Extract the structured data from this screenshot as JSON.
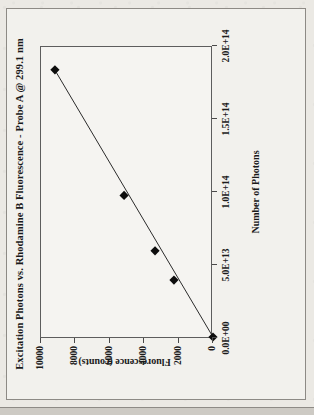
{
  "figure": {
    "background_color": "#ebe9e4",
    "frame_color": "#8d8a85",
    "rotation_note": "90-degrees-counter-clockwise"
  },
  "chart_data": {
    "type": "scatter",
    "title": "Excitation Photons vs. Rhodamine B Fluorescence - Probe A @ 299.1 nm",
    "xlabel": "Number of Photons",
    "ylabel": "Fluorescence (counts)",
    "xlim": [
      0,
      200000000000000
    ],
    "ylim": [
      0,
      10000
    ],
    "grid": false,
    "legend": null,
    "marker_style": "filled-diamond",
    "marker_color": "#0d0d0d",
    "trendline": {
      "present": true,
      "type": "linear-through-origin",
      "color": "#2b2b2b",
      "from": [
        0,
        0
      ],
      "to": [
        183000000000000,
        9200
      ]
    },
    "x_ticks": [
      0,
      50000000000000,
      100000000000000,
      150000000000000,
      200000000000000
    ],
    "x_tick_labels": [
      "0.0E+00",
      "5.0E+13",
      "1.0E+14",
      "1.5E+14",
      "2.0E+14"
    ],
    "y_ticks": [
      0,
      2000,
      4000,
      6000,
      8000,
      10000
    ],
    "y_tick_labels": [
      "0",
      "2000",
      "4000",
      "6000",
      "8000",
      "10000"
    ],
    "points": [
      {
        "x": 0,
        "y": 0
      },
      {
        "x": 39000000000000,
        "y": 2270
      },
      {
        "x": 59000000000000,
        "y": 3370
      },
      {
        "x": 97000000000000,
        "y": 5170
      },
      {
        "x": 183000000000000,
        "y": 9190
      }
    ],
    "x": [
      0,
      39000000000000,
      59000000000000,
      97000000000000,
      183000000000000
    ],
    "values": [
      0,
      2270,
      3370,
      5170,
      9190
    ]
  }
}
